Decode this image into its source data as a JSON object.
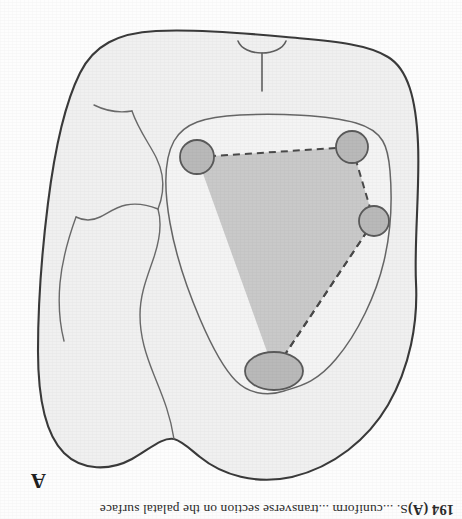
{
  "figure": {
    "panel_label": "A",
    "caption_prefix": "194 (A)",
    "caption_body": "S. ...cuniform ...transverse section on the palatal surface",
    "caption_full": "194 (A)  S. ...cuniform ...transverse section on the palatal surface",
    "orientation": "upside-down",
    "rotation_degrees": 180
  },
  "colors": {
    "page_background": "#fdfdfd",
    "outer_outline_stroke": "#3a3a3a",
    "outer_fill": "#f0f0f0",
    "inner_contour_stroke": "#666666",
    "inner_region_fill": "#f4f4f4",
    "shaded_polygon_fill": "#c9c9c9",
    "dashed_edge_stroke": "#4a4a4a",
    "node_fill": "#b9b9b9",
    "node_stroke": "#5a5a5a",
    "detail_line_stroke": "#6a6a6a",
    "caption_text": "#2b2b2b"
  },
  "diagram": {
    "outer_outline": {
      "name": "tooth-outline",
      "path": "M 46 236 C 44 196 52 152 74 114 C 94 80 128 52 170 42 C 206 34 240 44 262 62 C 272 70 280 78 288 80 C 300 82 312 70 330 60 C 352 48 380 48 398 66 C 416 84 424 120 424 168 C 424 216 420 268 414 316 C 408 364 398 414 382 446 C 368 474 344 486 306 488 C 268 490 218 486 176 482 C 134 478 96 476 74 462 C 54 450 46 420 44 376 C 42 332 48 276 46 236 Z"
    },
    "inner_contour": {
      "name": "pulp-chamber-contour",
      "path": "M 178 128 C 196 122 214 126 226 138 C 238 150 250 172 262 200 C 274 228 286 262 292 296 C 298 330 298 360 288 378 C 278 396 258 402 222 404 C 186 406 134 404 106 396 C 78 388 74 372 72 348 C 70 324 70 292 78 258 C 86 224 104 186 126 160 C 146 136 162 133 178 128 Z"
    },
    "shaded_polygon": {
      "name": "measurement-quadrilateral",
      "vertices": [
        {
          "id": "apex",
          "x": 188,
          "y": 148
        },
        {
          "id": "right",
          "x": 265,
          "y": 362
        },
        {
          "id": "bottom-left",
          "x": 110,
          "y": 372
        },
        {
          "id": "left",
          "x": 88,
          "y": 298
        }
      ]
    },
    "nodes": [
      {
        "name": "node-apex",
        "shape": "ellipse",
        "cx": 188,
        "cy": 148,
        "rx": 29,
        "ry": 19
      },
      {
        "name": "node-left",
        "shape": "circle",
        "cx": 88,
        "cy": 298,
        "r": 15
      },
      {
        "name": "node-bottom-left",
        "shape": "circle",
        "cx": 110,
        "cy": 372,
        "r": 16
      },
      {
        "name": "node-bottom-right",
        "shape": "circle",
        "cx": 265,
        "cy": 362,
        "r": 17
      }
    ],
    "detail_lines": [
      {
        "name": "cusp-fissure-line",
        "path": "M 288 80 C 292 106 300 124 308 144 C 316 164 322 182 322 204 C 322 226 314 244 308 262 C 302 280 300 296 304 310"
      },
      {
        "name": "lateral-ridge-line",
        "path": "M 304 310 C 314 314 326 316 336 314 C 346 312 354 306 362 302 C 370 298 378 298 386 302"
      },
      {
        "name": "cervical-line-upper",
        "path": "M 386 302 C 394 280 400 258 402 236 C 404 214 402 194 398 178"
      },
      {
        "name": "cervical-line-lower",
        "path": "M 304 310 C 300 320 298 332 300 344 C 302 356 308 366 314 376 C 320 386 326 396 330 408"
      },
      {
        "name": "marginal-notch-line",
        "path": "M 330 408 C 342 406 356 408 368 414"
      }
    ],
    "marker": {
      "name": "midline-notch-marker",
      "stem": {
        "x1": 200,
        "y1": 428,
        "x2": 200,
        "y2": 466
      },
      "arc_path": "M 176 478 C 182 462 218 462 224 478"
    }
  }
}
